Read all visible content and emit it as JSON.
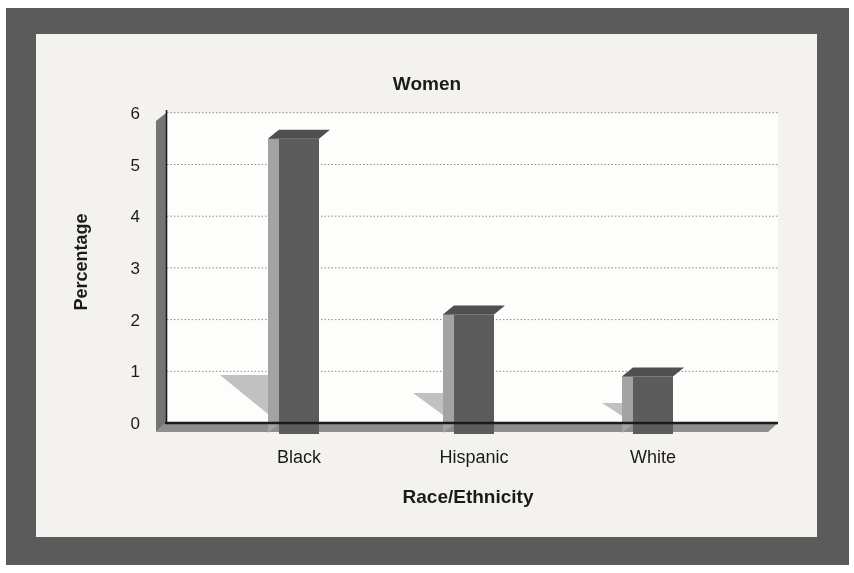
{
  "chart_data": {
    "type": "bar",
    "title": "Women",
    "categories": [
      "Black",
      "Hispanic",
      "White"
    ],
    "values": [
      5.5,
      2.1,
      0.9
    ],
    "xlabel": "Race/Ethnicity",
    "ylabel": "Percentage",
    "ylim": [
      0,
      6
    ],
    "yticks": [
      0,
      1,
      2,
      3,
      4,
      5,
      6
    ],
    "grid": "horizontal",
    "gridline_style": "dotted",
    "legend": "none",
    "style": "3d-column-grayscale-scan"
  },
  "colors": {
    "page_background": "#ffffff",
    "frame": "#5b5b5b",
    "card_background": "#f4f2ee",
    "plot_background": "#fdfdfc",
    "bar_front": "#5c5c5c",
    "bar_side": "#a3a3a3",
    "bar_top": "#4f4f4f",
    "wall": "#747474",
    "floor": "#8e8e8e",
    "shadow": "#b6b6b6",
    "gridline": "#8c8c8c",
    "axis": "#1b1b1b",
    "text": "#1b1b1b"
  }
}
